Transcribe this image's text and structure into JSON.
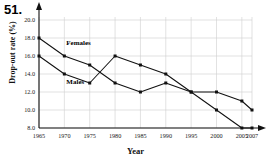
{
  "figure": {
    "number": "51.",
    "xlabel": "Year",
    "ylabel": "Drop-out rate (%)"
  },
  "chart_data": {
    "type": "line",
    "title": "",
    "xlabel": "Year",
    "ylabel": "Drop-out rate (%)",
    "x": [
      1965,
      1970,
      1975,
      1980,
      1985,
      1990,
      1995,
      2000,
      2005,
      2007
    ],
    "xtick_labels": [
      "1965",
      "1970",
      "1975",
      "1980",
      "1985",
      "1990",
      "1995",
      "2000",
      "2005",
      "2007"
    ],
    "ytick_labels": [
      "8.0",
      "10.0",
      "12.0",
      "14.0",
      "16.0",
      "18.0",
      "20.0"
    ],
    "ytick_values": [
      8.0,
      10.0,
      12.0,
      14.0,
      16.0,
      18.0,
      20.0
    ],
    "xlim": [
      1965,
      2007
    ],
    "ylim": [
      8.0,
      20.0
    ],
    "grid": true,
    "legend_position": "inline-annotation",
    "series": [
      {
        "name": "Females",
        "label": "Females",
        "color": "#111111",
        "marker": "square",
        "values": [
          18.0,
          16.0,
          15.0,
          13.0,
          12.0,
          13.0,
          12.0,
          12.0,
          11.0,
          10.0
        ]
      },
      {
        "name": "Males",
        "label": "Males",
        "color": "#111111",
        "marker": "square",
        "values": [
          16.0,
          14.0,
          13.0,
          16.0,
          15.0,
          14.0,
          12.0,
          10.0,
          8.0,
          8.0
        ]
      }
    ],
    "annotations": [
      {
        "text": "Females",
        "x": 1970,
        "y": 17.4
      },
      {
        "text": "Males",
        "x": 1970,
        "y": 13.1
      }
    ]
  }
}
